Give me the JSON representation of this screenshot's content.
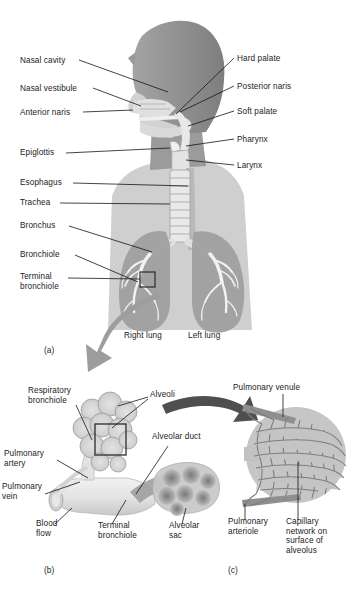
{
  "figure": {
    "background_color": "#ffffff",
    "text_color": "#1b1b1b"
  },
  "palette": {
    "body_silhouette": "#8d8d8d",
    "body_silhouette_light": "#b4b4b4",
    "airway_light": "#dcdcdc",
    "lung_fill": "#9a9a9a",
    "lung_light": "#c2c2c2",
    "bronchial_tree": "#f4f4f4",
    "arrow_gray": "#9d9d9d",
    "arrow_dark": "#4f4f4f",
    "alveoli_fill": "#c9c9c9",
    "alveoli_stroke": "#8f8f8f",
    "capillary_stroke": "#7e7e7e",
    "leader_line": "#151515",
    "callout_box": "#2b2b2b",
    "vessel_fill": "#e6e6e6"
  },
  "panels": [
    {
      "id": "a",
      "label": "(a)",
      "x": 44,
      "y": 345
    },
    {
      "id": "b",
      "label": "(b)",
      "x": 44,
      "y": 565
    },
    {
      "id": "c",
      "label": "(c)",
      "x": 228,
      "y": 565
    }
  ],
  "panel_a": {
    "labels_left": [
      {
        "name": "nasal-cavity",
        "text": "Nasal cavity",
        "x": 20,
        "y": 62,
        "align": "left"
      },
      {
        "name": "nasal-vestibule",
        "text": "Nasal vestibule",
        "x": 20,
        "y": 90,
        "align": "left"
      },
      {
        "name": "anterior-naris",
        "text": "Anterior naris",
        "x": 20,
        "y": 114,
        "align": "left"
      },
      {
        "name": "epiglottis",
        "text": "Epiglottis",
        "x": 20,
        "y": 155,
        "align": "left"
      },
      {
        "name": "esophagus",
        "text": "Esophagus",
        "x": 20,
        "y": 185,
        "align": "left"
      },
      {
        "name": "trachea",
        "text": "Trachea",
        "x": 20,
        "y": 205,
        "align": "left"
      },
      {
        "name": "bronchus",
        "text": "Bronchus",
        "x": 20,
        "y": 228,
        "align": "left"
      },
      {
        "name": "bronchiole",
        "text": "Bronchiole",
        "x": 20,
        "y": 257,
        "align": "left"
      },
      {
        "name": "terminal-bronchiole",
        "text": "Terminal\nbronchiole",
        "x": 20,
        "y": 277,
        "align": "left"
      }
    ],
    "labels_right": [
      {
        "name": "hard-palate",
        "text": "Hard palate",
        "x": 237,
        "y": 60
      },
      {
        "name": "posterior-naris",
        "text": "Posterior naris",
        "x": 237,
        "y": 88
      },
      {
        "name": "soft-palate",
        "text": "Soft palate",
        "x": 237,
        "y": 113
      },
      {
        "name": "pharynx",
        "text": "Pharynx",
        "x": 237,
        "y": 141
      },
      {
        "name": "larynx",
        "text": "Larynx",
        "x": 237,
        "y": 167
      }
    ],
    "lung_labels": [
      {
        "name": "right-lung",
        "text": "Right lung",
        "x": 124,
        "y": 337
      },
      {
        "name": "left-lung",
        "text": "Left lung",
        "x": 188,
        "y": 337
      }
    ]
  },
  "panel_b": {
    "labels": [
      {
        "name": "respiratory-bronchiole",
        "text": "Respiratory\nbronchiole",
        "x": 28,
        "y": 392,
        "align": "left"
      },
      {
        "name": "alveoli",
        "text": "Alveoli",
        "x": 150,
        "y": 395,
        "align": "left"
      },
      {
        "name": "alveolar-duct",
        "text": "Alveolar duct",
        "x": 152,
        "y": 437,
        "align": "left"
      },
      {
        "name": "pulmonary-artery",
        "text": "Pulmonary\nartery",
        "x": 6,
        "y": 455,
        "align": "left"
      },
      {
        "name": "pulmonary-vein",
        "text": "Pulmonary\nvein",
        "x": 2,
        "y": 488,
        "align": "left"
      },
      {
        "name": "blood-flow",
        "text": "Blood\nflow",
        "x": 36,
        "y": 525,
        "align": "left"
      },
      {
        "name": "terminal-bronchiole-b",
        "text": "Terminal\nbronchiole",
        "x": 98,
        "y": 527,
        "align": "left"
      },
      {
        "name": "alveolar-sac",
        "text": "Alveolar\nsac",
        "x": 169,
        "y": 527,
        "align": "left"
      }
    ]
  },
  "panel_c": {
    "labels": [
      {
        "name": "pulmonary-venule",
        "text": "Pulmonary venule",
        "x": 233,
        "y": 389,
        "align": "left"
      },
      {
        "name": "pulmonary-arteriole",
        "text": "Pulmonary\narteriole",
        "x": 228,
        "y": 522,
        "align": "left"
      },
      {
        "name": "capillary-network",
        "text": "Capillary\nnetwork on\nsurface of\nalveolus",
        "x": 286,
        "y": 522,
        "align": "left"
      }
    ]
  }
}
